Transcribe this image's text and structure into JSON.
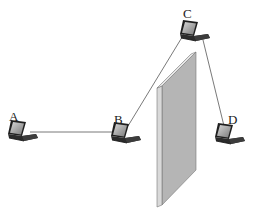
{
  "diagram": {
    "type": "wireless-network-topology",
    "nodes": [
      {
        "id": "A",
        "label": "A",
        "icon": "laptop-icon",
        "x": 22,
        "y": 131,
        "label_x": 10,
        "label_y": 109
      },
      {
        "id": "B",
        "label": "B",
        "icon": "laptop-icon",
        "x": 125,
        "y": 133,
        "label_x": 114,
        "label_y": 112
      },
      {
        "id": "C",
        "label": "C",
        "icon": "laptop-icon",
        "x": 194,
        "y": 32,
        "label_x": 183,
        "label_y": 6
      },
      {
        "id": "D",
        "label": "D",
        "icon": "laptop-icon",
        "x": 229,
        "y": 134,
        "label_x": 229,
        "label_y": 112
      }
    ],
    "edges": [
      {
        "from": "A",
        "to": "B"
      },
      {
        "from": "B",
        "to": "C"
      },
      {
        "from": "C",
        "to": "D"
      }
    ],
    "obstacle": {
      "name": "wall",
      "description": "grey vertical wall panel between B and D"
    },
    "colors": {
      "line": "#555555",
      "wall_face": "#b8b8b8",
      "wall_edge": "#e2e2e2",
      "wall_outline": "#666666",
      "laptop_body": "#2a2a2a",
      "laptop_screen": "#9a9a9a"
    }
  }
}
